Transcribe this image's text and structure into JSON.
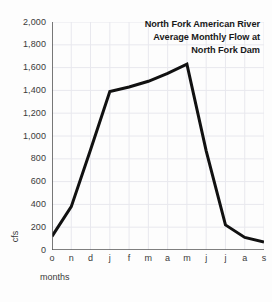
{
  "chart_data": {
    "type": "line",
    "title_lines": [
      "North Fork American River",
      "Average Monthly Flow at",
      "North Fork Dam"
    ],
    "xlabel": "months",
    "ylabel": "cfs",
    "categories": [
      "o",
      "n",
      "d",
      "j",
      "f",
      "m",
      "a",
      "m",
      "j",
      "j",
      "a",
      "s"
    ],
    "values": [
      120,
      380,
      880,
      1390,
      1430,
      1480,
      1550,
      1630,
      870,
      220,
      110,
      70
    ],
    "ylim": [
      0,
      2000
    ],
    "ytick_step": 200,
    "ytick_labels": [
      "0",
      "200",
      "400",
      "600",
      "800",
      "1,000",
      "1,200",
      "1,400",
      "1,600",
      "1,800",
      "2,000"
    ],
    "ytick_values": [
      0,
      200,
      400,
      600,
      800,
      1000,
      1200,
      1400,
      1600,
      1800,
      2000
    ],
    "grid": true,
    "legend": false,
    "series": [
      {
        "name": "Average Monthly Flow",
        "values": [
          120,
          380,
          880,
          1390,
          1430,
          1480,
          1550,
          1630,
          870,
          220,
          110,
          70
        ]
      }
    ],
    "colors": {
      "line": "#111111",
      "grid": "#e8e8ee",
      "axis": "#555555",
      "text": "#3a3a3a",
      "title_text": "#1a1a1a",
      "background": "#fdfdfd"
    },
    "line_width": 3
  }
}
